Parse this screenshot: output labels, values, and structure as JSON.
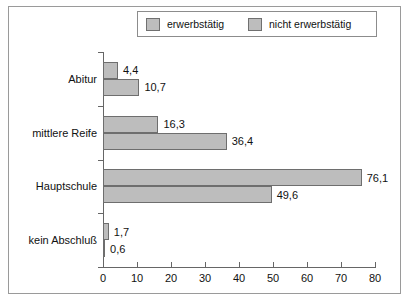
{
  "chart_data": {
    "type": "bar",
    "orientation": "horizontal",
    "title": "",
    "subtitle": "",
    "xlabel": "",
    "ylabel": "",
    "xlim": [
      0,
      80
    ],
    "xticks": [
      "0",
      "10",
      "20",
      "30",
      "40",
      "50",
      "60",
      "70",
      "80"
    ],
    "xtick_values": [
      0,
      10,
      20,
      30,
      40,
      50,
      60,
      70,
      80
    ],
    "grid": false,
    "legend_position": "top",
    "categories": [
      "Abitur",
      "mittlere Reife",
      "Hauptschule",
      "kein Abschluß"
    ],
    "series": [
      {
        "name": "erwerbstätig",
        "color": "#bdbdbd",
        "values": [
          4.4,
          16.3,
          76.1,
          1.7
        ],
        "labels": [
          "4,4",
          "16,3",
          "76,1",
          "1,7"
        ]
      },
      {
        "name": "nicht erwerbstätig",
        "color": "#bdbdbd",
        "values": [
          10.7,
          36.4,
          49.6,
          0.6
        ],
        "labels": [
          "10,7",
          "36,4",
          "49,6",
          "0,6"
        ]
      }
    ]
  },
  "legend": {
    "items": [
      {
        "label": "erwerbstätig"
      },
      {
        "label": "nicht erwerbstätig"
      }
    ]
  },
  "colors": {
    "bar_fill": "#bdbdbd",
    "bar_stroke": "#6e6e6e",
    "axis": "#666666",
    "frame": "#9a9a9a",
    "text": "#111111",
    "background": "#ffffff"
  }
}
